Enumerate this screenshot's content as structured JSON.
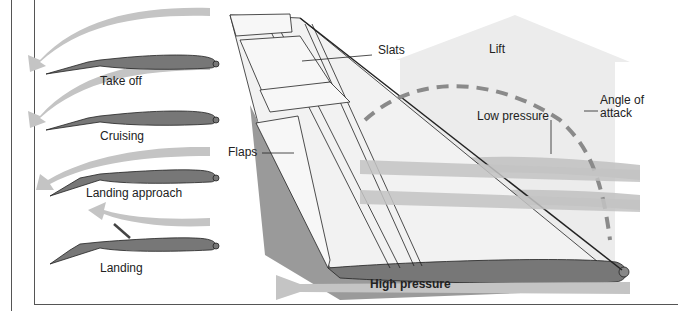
{
  "diagram": {
    "airfoil_stages": [
      {
        "label": "Take off"
      },
      {
        "label": "Cruising"
      },
      {
        "label": "Landing approach"
      },
      {
        "label": "Landing"
      }
    ],
    "wing_labels": {
      "slats": "Slats",
      "flaps": "Flaps",
      "lift": "Lift",
      "low_pressure": "Low pressure",
      "angle_of_attack": "Angle of\nattack",
      "high_pressure": "High pressure"
    },
    "colors": {
      "airfoil_fill": "#777777",
      "airflow_arrow": "#c4c4c4",
      "lift_arrow": "#ececec",
      "dashed_arc": "#8a8a8a",
      "outline": "#222222"
    }
  }
}
